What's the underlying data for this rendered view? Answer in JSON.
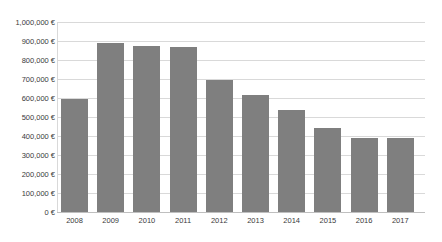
{
  "chart_data": {
    "type": "bar",
    "title": "",
    "subtitle": "",
    "xlabel": "",
    "ylabel": "",
    "categories": [
      "2008",
      "2009",
      "2010",
      "2011",
      "2012",
      "2013",
      "2014",
      "2015",
      "2016",
      "2017"
    ],
    "values": [
      595000,
      890000,
      873000,
      870000,
      695000,
      615000,
      535000,
      440000,
      388000,
      390000
    ],
    "ylim": [
      0,
      1000000
    ],
    "ytick_values": [
      0,
      100000,
      200000,
      300000,
      400000,
      500000,
      600000,
      700000,
      800000,
      900000,
      1000000
    ],
    "ytick_labels": [
      "0 €",
      "100,000 €",
      "200,000 €",
      "300,000 €",
      "400,000 €",
      "500,000 €",
      "600,000 €",
      "700,000 €",
      "800,000 €",
      "900,000 €",
      "1,000,000 €"
    ],
    "currency_symbol": "€",
    "grid": true,
    "grid_axis": "y",
    "legend": false,
    "legend_position": "none",
    "series": [
      {
        "name": "",
        "values": [
          595000,
          890000,
          873000,
          870000,
          695000,
          615000,
          535000,
          440000,
          388000,
          390000
        ]
      }
    ],
    "colors": {
      "bar_fill": "#7f7f7f",
      "gridline": "#d9d9d9",
      "baseline": "#bfbfbf",
      "tick_label": "#3a3a3a",
      "background": "#ffffff"
    }
  }
}
